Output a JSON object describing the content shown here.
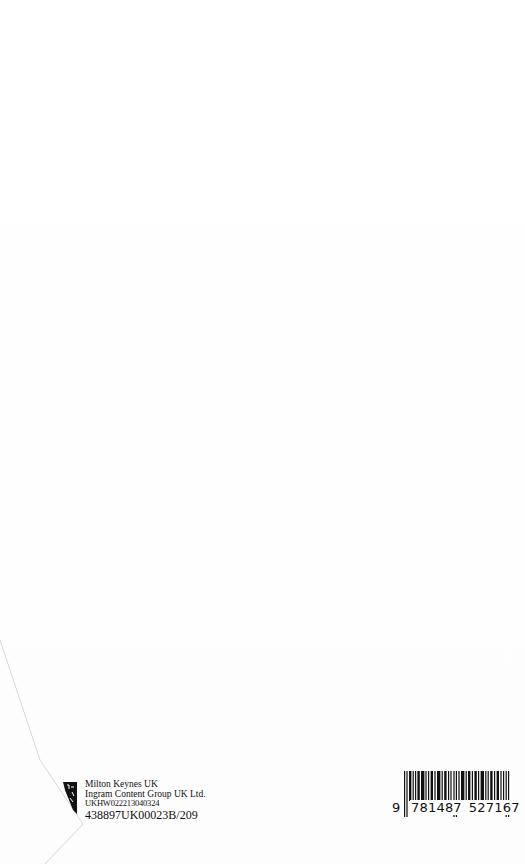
{
  "printer": {
    "line1": "Milton Keynes UK",
    "line2": "Ingram Content Group UK Ltd.",
    "line3": "UKHW022213040324",
    "line4": "438897UK00023B/209",
    "logo_icon": "printer-logo-icon"
  },
  "barcode": {
    "lead_digit": "9",
    "group1": "781487",
    "group2": "527167",
    "isbn": "9781487527167",
    "icon": "barcode-icon"
  }
}
